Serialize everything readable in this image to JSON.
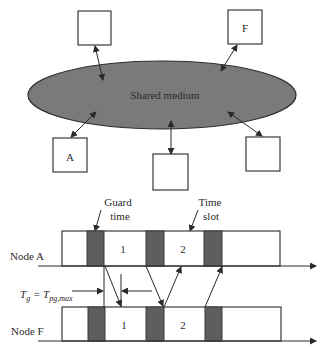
{
  "network": {
    "medium_label": "Shared medium",
    "nodes": [
      {
        "id": "top-left",
        "label": ""
      },
      {
        "id": "F",
        "label": "F"
      },
      {
        "id": "A",
        "label": "A"
      },
      {
        "id": "bottom-center",
        "label": ""
      },
      {
        "id": "right",
        "label": ""
      }
    ]
  },
  "timing": {
    "guard_label_line1": "Guard",
    "guard_label_line2": "time",
    "slot_label_line1": "Time",
    "slot_label_line2": "slot",
    "row_a_label": "Node A",
    "row_f_label": "Node F",
    "slot_numbers": [
      "1",
      "2"
    ],
    "tg_main": "T",
    "tg_sub": "g",
    "tg_equals": " = T",
    "tg_sub2": "pg,max"
  },
  "colors": {
    "medium": "#7a7a7a",
    "guard": "#5e5e5e",
    "line": "#2a2a2a"
  }
}
